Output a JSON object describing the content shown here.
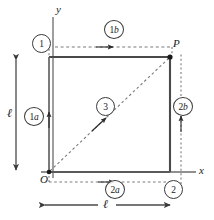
{
  "figure": {
    "name": "square-path-diagram",
    "colors": {
      "solid_line": "#555555",
      "dashed_line": "#6e6e6e",
      "dimension_line": "#4a4a4a",
      "text": "#1a1a1a",
      "background": "#ffffff"
    },
    "axes": {
      "x_label": "x",
      "y_label": "y"
    },
    "points": {
      "origin_label": "O",
      "corner_label": "P"
    },
    "dimensions": {
      "vertical_length_label": "ℓ",
      "horizontal_length_label": "ℓ"
    },
    "steps": [
      {
        "id": "step-1",
        "label": "1",
        "sub": "",
        "x": 32,
        "y": 34
      },
      {
        "id": "step-1a",
        "label": "1",
        "sub": "a",
        "x": 24,
        "y": 107
      },
      {
        "id": "step-1b",
        "label": "1",
        "sub": "b",
        "x": 104,
        "y": 20
      },
      {
        "id": "step-2",
        "label": "2",
        "sub": "",
        "x": 164,
        "y": 180
      },
      {
        "id": "step-2a",
        "label": "2",
        "sub": "a",
        "x": 105,
        "y": 180
      },
      {
        "id": "step-2b",
        "label": "2",
        "sub": "b",
        "x": 173,
        "y": 97
      },
      {
        "id": "step-3",
        "label": "3",
        "sub": "",
        "x": 96,
        "y": 97
      }
    ]
  }
}
